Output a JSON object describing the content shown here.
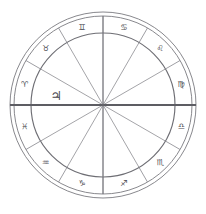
{
  "chart": {
    "type": "zodiac-wheel",
    "center": {
      "x": 103,
      "y": 105
    },
    "radii": {
      "outer_1": 93,
      "outer_2": 89,
      "inner": 72
    },
    "ring_count": 3,
    "house_count": 12,
    "sign_order_direction": "counter-clockwise",
    "ascendant_degree": 180,
    "signs": [
      {
        "name": "Pisces",
        "glyph": "♓",
        "angle": 195,
        "label_radius": 81
      },
      {
        "name": "Aries",
        "glyph": "♈",
        "angle": 165,
        "label_radius": 81
      },
      {
        "name": "Taurus",
        "glyph": "♉",
        "angle": 135,
        "label_radius": 81
      },
      {
        "name": "Gemini",
        "glyph": "♊",
        "angle": 105,
        "label_radius": 81
      },
      {
        "name": "Cancer",
        "glyph": "♋",
        "angle": 75,
        "label_radius": 81
      },
      {
        "name": "Leo",
        "glyph": "♌",
        "angle": 45,
        "label_radius": 81
      },
      {
        "name": "Virgo",
        "glyph": "♍",
        "angle": 15,
        "label_radius": 81
      },
      {
        "name": "Libra",
        "glyph": "♎",
        "angle": 345,
        "label_radius": 81
      },
      {
        "name": "Scorpio",
        "glyph": "♏",
        "angle": 315,
        "label_radius": 81
      },
      {
        "name": "Sagittarius",
        "glyph": "♐",
        "angle": 285,
        "label_radius": 81
      },
      {
        "name": "Capricorn",
        "glyph": "♑",
        "angle": 255,
        "label_radius": 81
      },
      {
        "name": "Aquarius",
        "glyph": "♒",
        "angle": 225,
        "label_radius": 81
      }
    ],
    "planets": [
      {
        "name": "Jupiter",
        "glyph": "♃",
        "angle": 168,
        "radius": 48
      }
    ],
    "axes": [
      {
        "name": "ascendant-descendant",
        "angle": 180,
        "emphasis": "heavy"
      },
      {
        "name": "midheaven-imum-coeli",
        "angle": 90,
        "emphasis": "light"
      }
    ],
    "colors": {
      "background": "#ffffff",
      "ring_stroke": "#7a7a80",
      "line_stroke": "#85858b",
      "axis_stroke": "#5d5d63",
      "glyph_fill": "#4a4a50"
    }
  }
}
